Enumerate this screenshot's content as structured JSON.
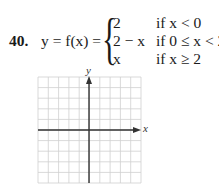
{
  "problem": {
    "number": "40.",
    "lhs": "y = f(x) =",
    "cases": [
      {
        "expr": "2",
        "condition": "if x < 0"
      },
      {
        "expr": "2 − x",
        "condition": "if 0 ≤ x < 2"
      },
      {
        "expr": "x",
        "condition": "if x ≥ 2"
      }
    ]
  },
  "graph": {
    "grid_cols": 10,
    "grid_rows": 10,
    "origin_col": 5,
    "origin_row": 5,
    "x_axis_label": "x",
    "y_axis_label": "y",
    "grid_color": "#cfcfcf",
    "axis_color": "#333333"
  }
}
